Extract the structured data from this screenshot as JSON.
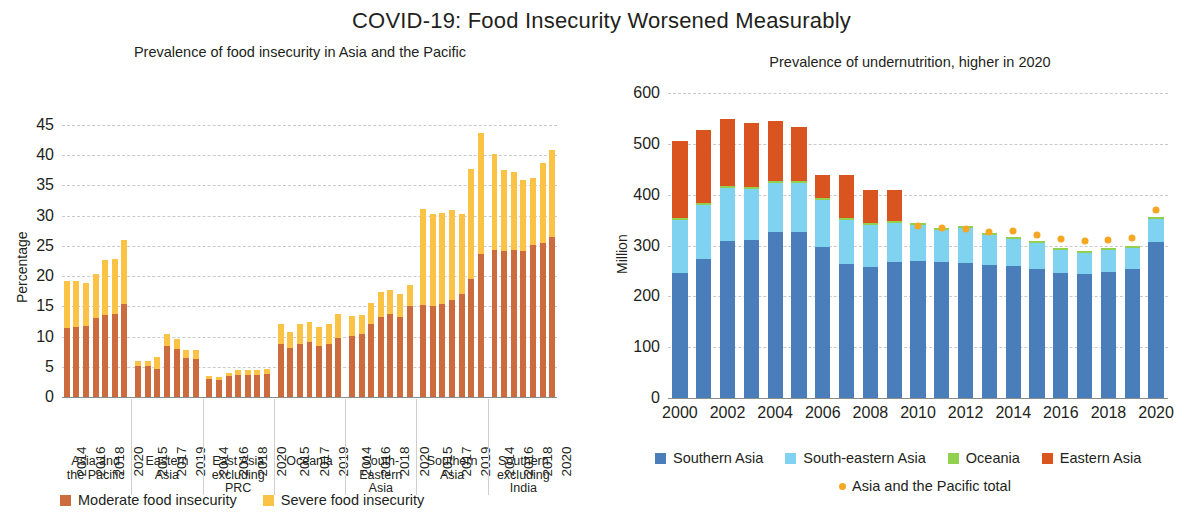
{
  "title": "COVID-19: Food Insecurity Worsened Measurably",
  "left_panel": {
    "subtitle": "Prevalence of food insecurity in Asia and the Pacific",
    "legend": [
      {
        "label": "Moderate food insecurity",
        "color": "#CC6B3D",
        "marker": "square"
      },
      {
        "label": "Severe food insecurity",
        "color": "#FBC346",
        "marker": "square"
      }
    ]
  },
  "right_panel": {
    "subtitle": "Prevalence of undernutrition, higher in 2020",
    "legend": [
      {
        "label": "Southern Asia",
        "color": "#4A7EBB",
        "marker": "square"
      },
      {
        "label": "South-eastern Asia",
        "color": "#7FD3F0",
        "marker": "square"
      },
      {
        "label": "Oceania",
        "color": "#92D050",
        "marker": "square"
      },
      {
        "label": "Eastern Asia",
        "color": "#D9541E",
        "marker": "square"
      },
      {
        "label": "Asia and the Pacific total",
        "color": "#F5A623",
        "marker": "dot"
      }
    ]
  },
  "chart_data": [
    {
      "type": "bar",
      "id": "food-insecurity",
      "title": "Prevalence of food insecurity in Asia and the Pacific",
      "xlabel": "",
      "ylabel": "Percentage",
      "ylim": [
        0,
        45
      ],
      "yticks": [
        0,
        5,
        10,
        15,
        20,
        25,
        30,
        35,
        40,
        45
      ],
      "grid": true,
      "stacked": true,
      "series_names": [
        "Moderate food insecurity",
        "Severe food insecurity"
      ],
      "series_colors": [
        "#CC6B3D",
        "#FBC346"
      ],
      "groups": [
        {
          "name": "Asia and the Pacific",
          "label_lines": "Asia and\nthe Pacific",
          "years": [
            2014,
            2015,
            2016,
            2017,
            2018,
            2019,
            2020
          ],
          "tick_years": [
            "2014",
            "",
            "2016",
            "",
            "2018",
            "",
            "2020"
          ],
          "moderate": [
            11.4,
            11.5,
            11.8,
            13.1,
            13.6,
            13.7,
            15.4
          ],
          "severe": [
            7.8,
            7.7,
            7.1,
            7.2,
            9.0,
            9.1,
            10.5
          ]
        },
        {
          "name": "Eastern Asia",
          "label_lines": "Eastern\nAsia",
          "years": [
            2014,
            2015,
            2016,
            2017,
            2018,
            2019,
            2020
          ],
          "tick_years": [
            "",
            "2015",
            "",
            "2017",
            "",
            "2019",
            ""
          ],
          "moderate": [
            5.2,
            5.1,
            4.6,
            8.4,
            7.9,
            6.5,
            6.3
          ],
          "severe": [
            0.8,
            0.8,
            2.0,
            2.0,
            1.7,
            1.3,
            1.4
          ]
        },
        {
          "name": "East Asia excluding PRC",
          "label_lines": "East Asia\nexcluding\nPRC",
          "years": [
            2014,
            2015,
            2016,
            2017,
            2018,
            2019,
            2020
          ],
          "tick_years": [
            "2014",
            "",
            "2016",
            "",
            "2018",
            "",
            "2020"
          ],
          "moderate": [
            2.9,
            2.8,
            3.4,
            3.6,
            3.6,
            3.6,
            3.8
          ],
          "severe": [
            0.6,
            0.5,
            0.6,
            0.8,
            0.9,
            0.8,
            0.9
          ]
        },
        {
          "name": "Oceania",
          "label_lines": "Oceania",
          "years": [
            2014,
            2015,
            2016,
            2017,
            2018,
            2019,
            2020
          ],
          "tick_years": [
            "",
            "2015",
            "",
            "2017",
            "",
            "2019",
            ""
          ],
          "moderate": [
            8.7,
            8.1,
            8.8,
            9.1,
            8.4,
            8.7,
            9.7
          ],
          "severe": [
            3.3,
            2.6,
            3.2,
            3.3,
            3.2,
            3.3,
            4.0
          ]
        },
        {
          "name": "South-Eastern Asia",
          "label_lines": "South-\nEastern\nAsia",
          "years": [
            2014,
            2015,
            2016,
            2017,
            2018,
            2019,
            2020
          ],
          "tick_years": [
            "2014",
            "",
            "2016",
            "",
            "2018",
            "",
            "2020"
          ],
          "moderate": [
            10.1,
            10.4,
            12.0,
            13.2,
            13.7,
            13.3,
            15.1
          ],
          "severe": [
            3.3,
            3.2,
            3.6,
            4.1,
            4.0,
            3.7,
            3.5
          ]
        },
        {
          "name": "Southern Asia",
          "label_lines": "Southern\nAsia",
          "years": [
            2014,
            2015,
            2016,
            2017,
            2018,
            2019,
            2020
          ],
          "tick_years": [
            "",
            "2015",
            "",
            "2017",
            "",
            "2019",
            ""
          ],
          "moderate": [
            15.2,
            15.1,
            15.4,
            16.0,
            17.0,
            19.5,
            23.7
          ],
          "severe": [
            15.9,
            15.2,
            15.0,
            15.0,
            13.3,
            18.2,
            19.9
          ]
        },
        {
          "name": "Southern excluding India",
          "label_lines": "Southern\nexcluding\nIndia",
          "years": [
            2014,
            2015,
            2016,
            2017,
            2018,
            2019,
            2020
          ],
          "tick_years": [
            "2014",
            "",
            "2016",
            "",
            "2018",
            "",
            "2020"
          ],
          "moderate": [
            24.4,
            24.1,
            24.3,
            24.2,
            25.2,
            25.5,
            26.5
          ],
          "severe": [
            15.8,
            13.5,
            12.9,
            11.7,
            11.1,
            13.2,
            14.4
          ]
        }
      ]
    },
    {
      "type": "bar",
      "id": "undernutrition",
      "title": "Prevalence of undernutrition, higher in 2020",
      "xlabel": "",
      "ylabel": "Million",
      "ylim": [
        0,
        600
      ],
      "yticks": [
        0,
        100,
        200,
        300,
        400,
        500,
        600
      ],
      "grid": true,
      "stacked": true,
      "series_names": [
        "Southern Asia",
        "South-eastern Asia",
        "Oceania",
        "Eastern Asia"
      ],
      "series_colors": [
        "#4A7EBB",
        "#7FD3F0",
        "#92D050",
        "#D9541E"
      ],
      "overlay_marker": {
        "name": "Asia and the Pacific total",
        "color": "#F5A623"
      },
      "x": [
        2000,
        2001,
        2002,
        2003,
        2004,
        2005,
        2006,
        2007,
        2008,
        2009,
        2010,
        2011,
        2012,
        2013,
        2014,
        2015,
        2016,
        2017,
        2018,
        2019,
        2020
      ],
      "tick_labels": [
        "2000",
        "",
        "2002",
        "",
        "2004",
        "",
        "2006",
        "",
        "2008",
        "",
        "2010",
        "",
        "2012",
        "",
        "2014",
        "",
        "2016",
        "",
        "2018",
        "",
        "2020"
      ],
      "series": [
        {
          "name": "Southern Asia",
          "values": [
            245,
            273,
            308,
            311,
            327,
            327,
            297,
            264,
            258,
            268,
            270,
            268,
            266,
            262,
            260,
            254,
            245,
            243,
            247,
            254,
            307
          ]
        },
        {
          "name": "South-eastern Asia",
          "values": [
            105,
            107,
            105,
            101,
            96,
            96,
            93,
            86,
            82,
            76,
            70,
            63,
            68,
            58,
            53,
            51,
            46,
            43,
            44,
            42,
            45
          ]
        },
        {
          "name": "Oceania",
          "values": [
            4,
            4,
            4,
            4,
            4,
            4,
            4,
            4,
            4,
            4,
            4,
            4,
            4,
            4,
            4,
            4,
            4,
            4,
            4,
            4,
            4
          ]
        },
        {
          "name": "Eastern Asia",
          "values": [
            151,
            144,
            132,
            125,
            118,
            107,
            44,
            85,
            66,
            62,
            0,
            0,
            0,
            0,
            0,
            0,
            0,
            0,
            0,
            0,
            0
          ]
        }
      ],
      "total_marker_values": [
        null,
        null,
        null,
        null,
        null,
        null,
        null,
        null,
        null,
        null,
        344,
        341,
        339,
        333,
        334,
        327,
        318,
        314,
        317,
        320,
        375
      ]
    }
  ]
}
